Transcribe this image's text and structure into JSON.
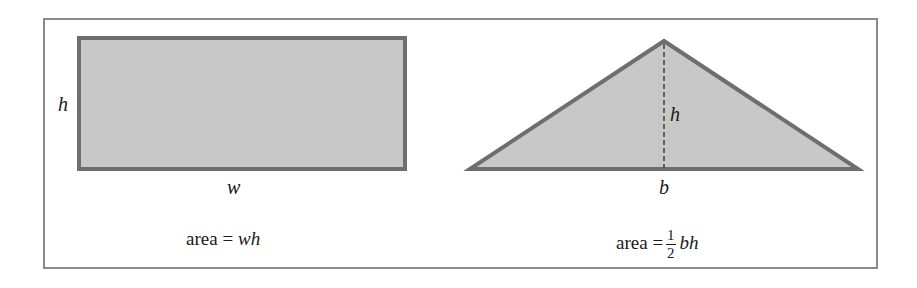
{
  "colors": {
    "shape_fill": "#c8c8c8",
    "shape_stroke": "#6e6e6e",
    "frame_border": "#8a8a8a",
    "text": "#1a1a1a"
  },
  "rectangle": {
    "height_label": "h",
    "width_label": "w",
    "formula": {
      "prefix": "area =",
      "expression": "wh"
    }
  },
  "triangle": {
    "height_label": "h",
    "base_label": "b",
    "formula": {
      "prefix": "area =",
      "fraction_numerator": "1",
      "fraction_denominator": "2",
      "expression": "bh"
    }
  }
}
